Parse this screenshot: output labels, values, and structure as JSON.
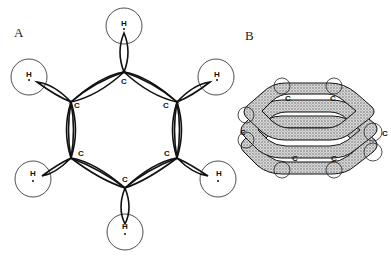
{
  "panels": [
    {
      "label": "A",
      "description": "sigma-bond framework of benzene: sp2 orbital overlaps",
      "carbon_label": "C",
      "hydrogen_label": "H",
      "carbons": 6,
      "hydrogens": 6
    },
    {
      "label": "B",
      "description": "delocalized pi-electron clouds above and below the ring",
      "carbon_label": "C"
    }
  ],
  "colors": {
    "line": "#111111",
    "shade": "#9a9a9a",
    "background": "#ffffff"
  }
}
